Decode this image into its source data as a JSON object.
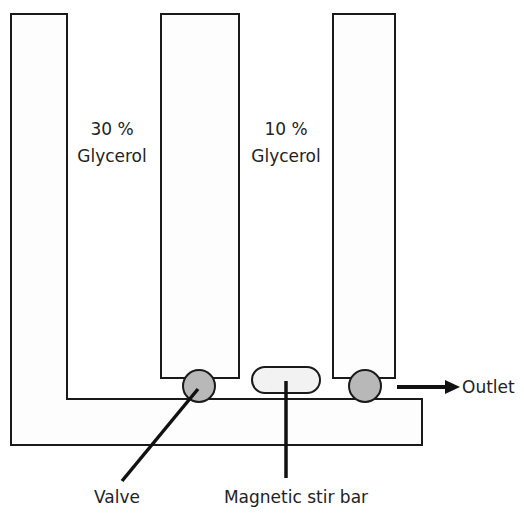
{
  "diagram": {
    "labels": {
      "chamber_left_pct": "30 %",
      "chamber_left_name": "Glycerol",
      "chamber_mid_pct": "10 %",
      "chamber_mid_name": "Glycerol",
      "valve": "Valve",
      "stir_bar": "Magnetic stir bar",
      "outlet": "Outlet"
    },
    "colors": {
      "stroke": "#1a1a1a",
      "valve_fill": "#b8b8b8",
      "stir_bar_fill": "#f2f2f2",
      "background": "#ffffff"
    }
  }
}
